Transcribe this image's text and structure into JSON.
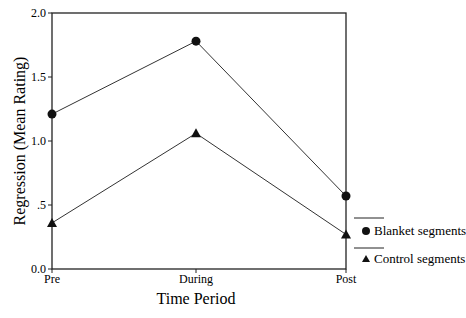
{
  "chart_data": {
    "type": "line",
    "title": "",
    "xlabel": "Time Period",
    "ylabel": "Regression (Mean Rating)",
    "categories": [
      "Pre",
      "During",
      "Post"
    ],
    "ylim": [
      0,
      2.0
    ],
    "yticks": [
      "0.0",
      ".5",
      "1.0",
      "1.5",
      "2.0"
    ],
    "grid": false,
    "legend_position": "right-bottom",
    "series": [
      {
        "name": "Blanket segments",
        "marker": "circle",
        "values": [
          1.21,
          1.78,
          0.57
        ]
      },
      {
        "name": "Control segments",
        "marker": "triangle",
        "values": [
          0.36,
          1.06,
          0.27
        ]
      }
    ]
  }
}
